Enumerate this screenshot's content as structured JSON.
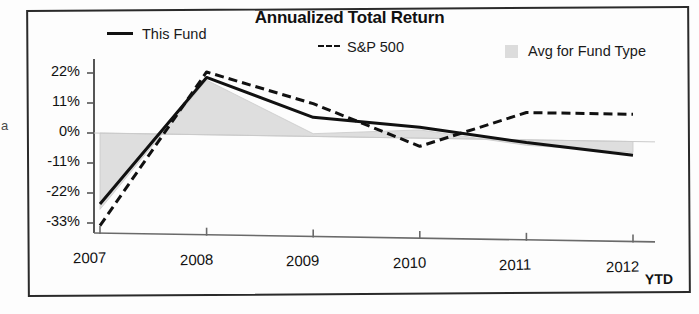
{
  "chart_data": {
    "type": "line",
    "title": "Annualized Total Return",
    "xlabel": "",
    "ylabel": "",
    "x_axis_note": "YTD",
    "categories": [
      "2007",
      "2008",
      "2009",
      "2010",
      "2011",
      "2012"
    ],
    "ylim": [
      -33,
      22
    ],
    "yticks": [
      "22%",
      "11%",
      "0%",
      "-11%",
      "-22%",
      "-33%"
    ],
    "ytick_values": [
      22,
      11,
      0,
      -11,
      -22,
      -33
    ],
    "grid": false,
    "legend_position": "top",
    "series": [
      {
        "name": "This Fund",
        "style": "solid-line",
        "color": "#111111",
        "values": [
          -26,
          21,
          7,
          4,
          -1,
          -5
        ]
      },
      {
        "name": "S&P 500",
        "style": "dashed-line",
        "color": "#111111",
        "values": [
          -34,
          23,
          12,
          -3,
          10,
          10
        ]
      },
      {
        "name": "Avg for Fund Type",
        "style": "filled-area",
        "color": "#dcdcdc",
        "values": [
          -28,
          20,
          1,
          3,
          -2,
          -4
        ]
      }
    ]
  },
  "legend": {
    "this_fund": "This Fund",
    "sp500": "S&P 500",
    "avg_for_fund_type": "Avg for Fund Type"
  },
  "axis": {
    "ytd_note": "YTD"
  },
  "page": {
    "clipped_margin_text": "a"
  }
}
